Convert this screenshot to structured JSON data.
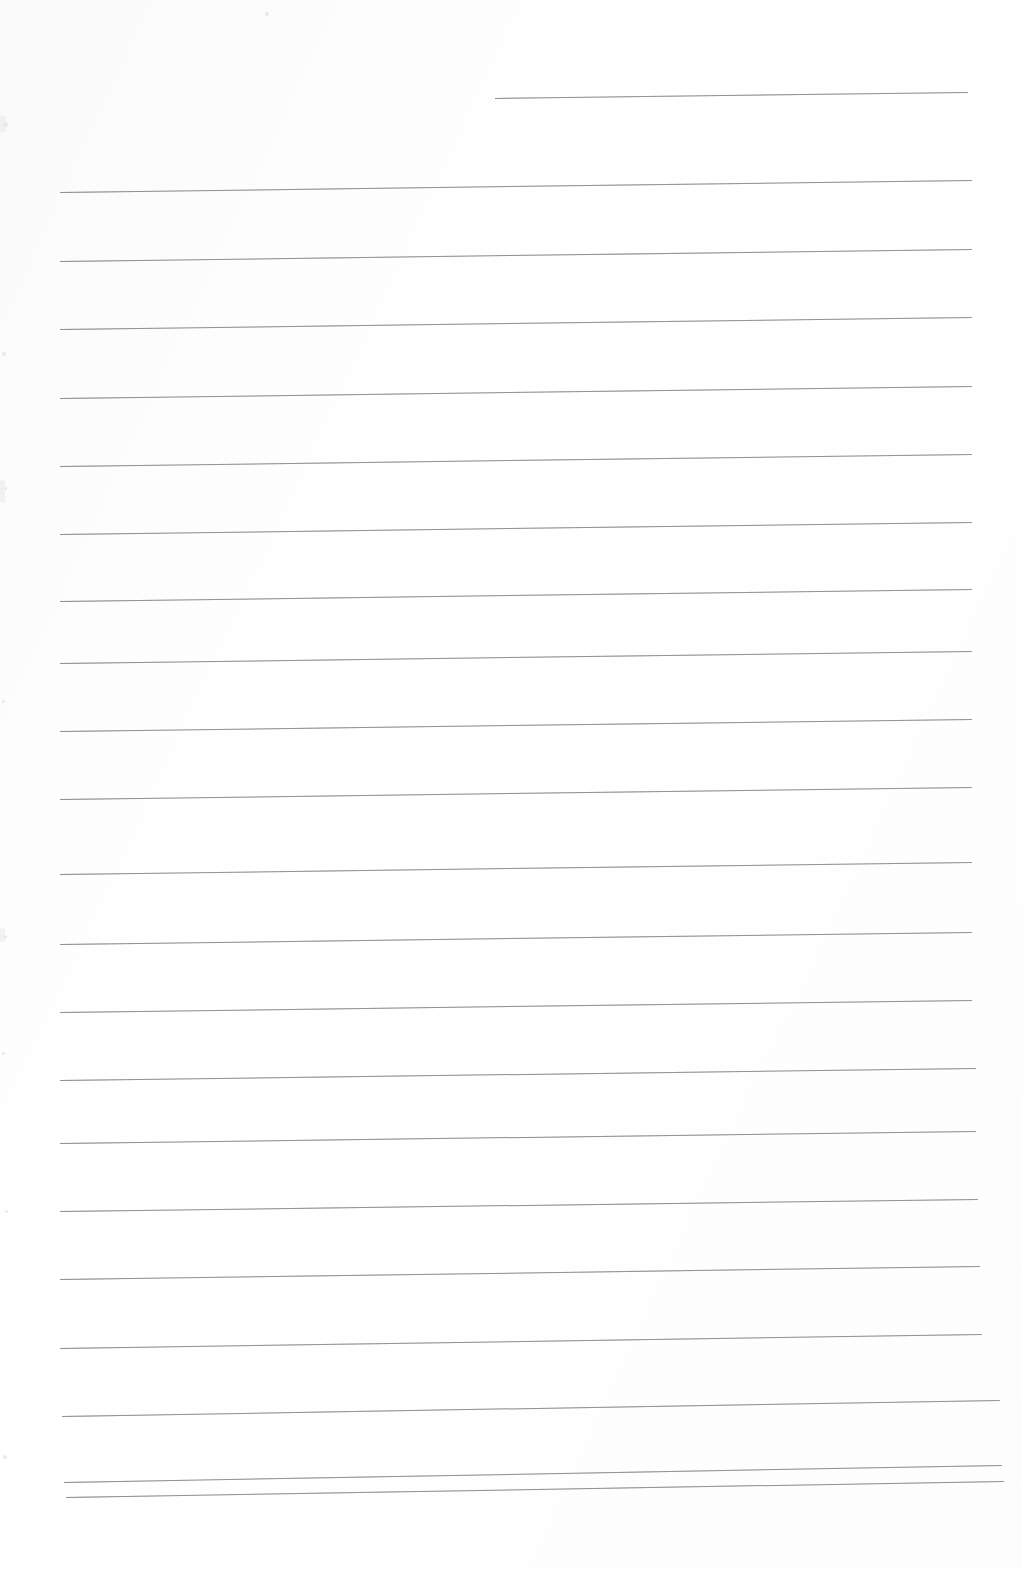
{
  "document": {
    "kind": "scanned-blank-lined-page",
    "title": "Blank Ruled Paper (Scan)",
    "page_width": 1022,
    "page_height": 1569,
    "background_color": "#ffffff",
    "rule_color": "#8d8d8d",
    "content_text": "",
    "handwriting_present": "none",
    "printed_text_present": "none"
  },
  "ruling": {
    "line_count": 22,
    "nominal_spacing_px": 68,
    "stroke_width_px": 1,
    "skew_note": "lines rise slightly toward the right edge",
    "first_line_is_partial": true,
    "left_margin_x": 60,
    "right_margin_x": 975
  },
  "lines": [
    {
      "index": 1,
      "x1": 495,
      "y1": 98,
      "x2": 968,
      "y2": 92
    },
    {
      "index": 2,
      "x1": 60,
      "y1": 192,
      "x2": 972,
      "y2": 180
    },
    {
      "index": 3,
      "x1": 60,
      "y1": 261,
      "x2": 972,
      "y2": 249
    },
    {
      "index": 4,
      "x1": 60,
      "y1": 329,
      "x2": 972,
      "y2": 317
    },
    {
      "index": 5,
      "x1": 60,
      "y1": 398,
      "x2": 972,
      "y2": 386
    },
    {
      "index": 6,
      "x1": 60,
      "y1": 466,
      "x2": 972,
      "y2": 454
    },
    {
      "index": 7,
      "x1": 60,
      "y1": 534,
      "x2": 972,
      "y2": 522
    },
    {
      "index": 8,
      "x1": 60,
      "y1": 601,
      "x2": 972,
      "y2": 589
    },
    {
      "index": 9,
      "x1": 60,
      "y1": 663,
      "x2": 972,
      "y2": 651
    },
    {
      "index": 10,
      "x1": 60,
      "y1": 731,
      "x2": 972,
      "y2": 719
    },
    {
      "index": 11,
      "x1": 60,
      "y1": 799,
      "x2": 972,
      "y2": 787
    },
    {
      "index": 12,
      "x1": 60,
      "y1": 874,
      "x2": 972,
      "y2": 862
    },
    {
      "index": 13,
      "x1": 60,
      "y1": 944,
      "x2": 972,
      "y2": 932
    },
    {
      "index": 14,
      "x1": 60,
      "y1": 1012,
      "x2": 972,
      "y2": 1000
    },
    {
      "index": 15,
      "x1": 60,
      "y1": 1080,
      "x2": 976,
      "y2": 1068
    },
    {
      "index": 16,
      "x1": 60,
      "y1": 1143,
      "x2": 976,
      "y2": 1131
    },
    {
      "index": 17,
      "x1": 60,
      "y1": 1211,
      "x2": 978,
      "y2": 1199
    },
    {
      "index": 18,
      "x1": 60,
      "y1": 1279,
      "x2": 980,
      "y2": 1266
    },
    {
      "index": 19,
      "x1": 60,
      "y1": 1348,
      "x2": 982,
      "y2": 1334
    },
    {
      "index": 20,
      "x1": 62,
      "y1": 1416,
      "x2": 1000,
      "y2": 1400
    },
    {
      "index": 21,
      "x1": 64,
      "y1": 1482,
      "x2": 1002,
      "y2": 1465
    },
    {
      "index": 22,
      "x1": 66,
      "y1": 1497,
      "x2": 1004,
      "y2": 1481
    }
  ],
  "scan_artifacts": {
    "specks": [
      {
        "x": 265,
        "y": 12,
        "size": 4
      },
      {
        "x": 3,
        "y": 122,
        "size": 5
      },
      {
        "x": 2,
        "y": 352,
        "size": 4
      },
      {
        "x": 4,
        "y": 487,
        "size": 3
      },
      {
        "x": 2,
        "y": 700,
        "size": 3
      },
      {
        "x": 3,
        "y": 935,
        "size": 4
      },
      {
        "x": 2,
        "y": 1052,
        "size": 3
      },
      {
        "x": 5,
        "y": 1210,
        "size": 3
      },
      {
        "x": 3,
        "y": 1455,
        "size": 4
      }
    ],
    "edge_smudges": [
      {
        "x": 0,
        "y": 116,
        "w": 6,
        "h": 16
      },
      {
        "x": 0,
        "y": 480,
        "w": 5,
        "h": 22
      },
      {
        "x": 0,
        "y": 928,
        "w": 5,
        "h": 14
      }
    ]
  }
}
